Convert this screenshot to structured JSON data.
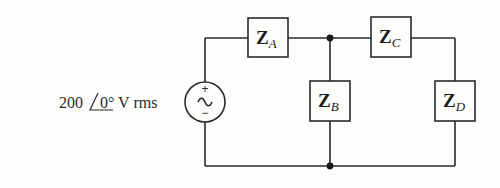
{
  "diagram": {
    "type": "ac-circuit",
    "source": {
      "magnitude": "200",
      "angle": "0°",
      "unit": " V rms",
      "plus_sign": "+",
      "minus_sign": "−",
      "symbol": "~"
    },
    "impedances": [
      {
        "id": "A",
        "main": "Z",
        "sub": "A",
        "position": "series-top-left"
      },
      {
        "id": "B",
        "main": "Z",
        "sub": "B",
        "position": "shunt-middle"
      },
      {
        "id": "C",
        "main": "Z",
        "sub": "C",
        "position": "series-top-right"
      },
      {
        "id": "D",
        "main": "Z",
        "sub": "D",
        "position": "shunt-right"
      }
    ],
    "nodes": [
      {
        "name": "top-junction"
      },
      {
        "name": "bottom-junction"
      }
    ],
    "colors": {
      "line": "#2a2a2a",
      "background": "#fdfdfc"
    }
  }
}
